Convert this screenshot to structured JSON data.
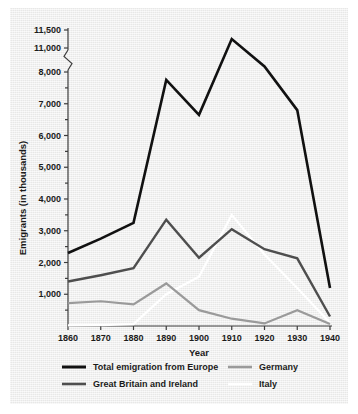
{
  "chart_data": {
    "type": "line",
    "title": "",
    "xlabel": "Year",
    "ylabel": "Emigrants (in thousands)",
    "x": [
      1860,
      1870,
      1880,
      1890,
      1900,
      1910,
      1920,
      1930,
      1940
    ],
    "xtick_labels": [
      "1860",
      "1870",
      "1880",
      "1890",
      "1900",
      "1910",
      "1920",
      "1930",
      "1940"
    ],
    "ytick_labels": [
      "1,000",
      "2,000",
      "3,000",
      "4,000",
      "5,000",
      "6,000",
      "7,000",
      "8,000",
      "11,000",
      "11,500"
    ],
    "ytick_values": [
      1000,
      2000,
      3000,
      4000,
      5000,
      6000,
      7000,
      8000,
      11000,
      11500
    ],
    "ylim": [
      0,
      11500
    ],
    "xlim": [
      1860,
      1940
    ],
    "axis_break": {
      "present": true,
      "between": [
        8000,
        11000
      ],
      "symbol": "zigzag"
    },
    "grid": false,
    "legend_position": "bottom",
    "series": [
      {
        "name": "Total emigration from Europe",
        "color": "#111111",
        "width": 2.6,
        "values": [
          2300,
          2750,
          3250,
          7750,
          6650,
          11250,
          8700,
          6800,
          1200
        ]
      },
      {
        "name": "Great Britain and Ireland",
        "color": "#4e4e4e",
        "width": 2.4,
        "values": [
          1400,
          1600,
          1820,
          3350,
          2150,
          3050,
          2420,
          2130,
          300
        ]
      },
      {
        "name": "Germany",
        "color": "#9a9a9a",
        "width": 2.2,
        "values": [
          720,
          780,
          680,
          1340,
          500,
          230,
          80,
          500,
          60
        ]
      },
      {
        "name": "Italy",
        "color": "#ffffff",
        "width": 2.2,
        "values": [
          20,
          30,
          60,
          1000,
          1550,
          3500,
          2250,
          1200,
          100
        ]
      }
    ]
  },
  "axis": {
    "y_title": "Emigrants (in thousands)",
    "x_title": "Year"
  },
  "legend": {
    "entries": [
      {
        "label": "Total emigration from Europe",
        "color": "#111111"
      },
      {
        "label": "Great Britain and Ireland",
        "color": "#4e4e4e"
      },
      {
        "label": "Germany",
        "color": "#9a9a9a"
      },
      {
        "label": "Italy",
        "color": "#ffffff"
      }
    ]
  }
}
